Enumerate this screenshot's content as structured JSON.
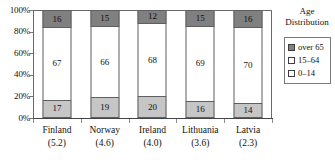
{
  "chart_data": {
    "type": "bar",
    "subtype": "stacked-percent-column",
    "title": "",
    "xlabel": "",
    "ylabel": "",
    "ylim": [
      0,
      100
    ],
    "yticks": [
      "0%",
      "20%",
      "40%",
      "60%",
      "80%",
      "100%"
    ],
    "ytick_values": [
      0,
      20,
      40,
      60,
      80,
      100
    ],
    "grid": false,
    "legend_position": "right",
    "categories": [
      "Finland",
      "Norway",
      "Ireland",
      "Lithuania",
      "Latvia"
    ],
    "category_values": [
      "(5.2)",
      "(4.6)",
      "(4.0)",
      "(3.6)",
      "(2.3)"
    ],
    "series": [
      {
        "name": "over 65",
        "color": "#808080",
        "values": [
          16,
          15,
          12,
          15,
          16
        ]
      },
      {
        "name": "15–64",
        "color": "#ffffff",
        "values": [
          67,
          66,
          68,
          69,
          70
        ]
      },
      {
        "name": "0–14",
        "color": "#c6c6c6",
        "values": [
          17,
          19,
          20,
          16,
          14
        ]
      }
    ],
    "legend": {
      "title_line1": "Age",
      "title_line2": "Distribution",
      "entries": [
        {
          "label": "over 65",
          "color": "#808080"
        },
        {
          "label": "15–64",
          "color": "#ffffff"
        },
        {
          "label": "0–14",
          "color": "#ffffff"
        }
      ]
    }
  }
}
